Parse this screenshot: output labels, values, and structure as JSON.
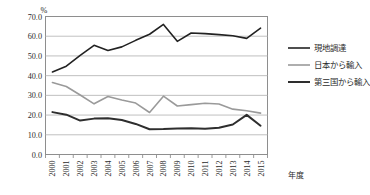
{
  "chart_data": {
    "type": "line",
    "title": "",
    "xlabel": "年度",
    "ylabel": "",
    "yunit": "%",
    "ylim": [
      0.0,
      70.0
    ],
    "ytick_step": 10.0,
    "ytick_labels": [
      "0.0",
      "10.0",
      "20.0",
      "30.0",
      "40.0",
      "50.0",
      "60.0",
      "70.0"
    ],
    "grid": true,
    "grid_axis": "y",
    "legend_position": "right",
    "categories": [
      "2000",
      "2001",
      "2002",
      "2003",
      "2004",
      "2005",
      "2006",
      "2007",
      "2008",
      "2009",
      "2010",
      "2011",
      "2012",
      "2013",
      "2014",
      "2015"
    ],
    "series": [
      {
        "name": "現地調達",
        "color": "#222222",
        "width": 1.6,
        "values": [
          41.9,
          44.8,
          50.3,
          55.4,
          52.8,
          54.6,
          57.9,
          61.0,
          66.0,
          57.4,
          61.6,
          61.3,
          60.8,
          60.2,
          58.9,
          64.1
        ]
      },
      {
        "name": "日本から輸入",
        "color": "#9a9a9a",
        "width": 1.6,
        "values": [
          36.5,
          34.5,
          30.2,
          25.7,
          29.4,
          27.6,
          26.1,
          21.3,
          29.6,
          24.6,
          25.3,
          26.0,
          25.6,
          23.0,
          22.2,
          21.0
        ]
      },
      {
        "name": "第三国から輸入",
        "color": "#2e2e2e",
        "width": 2.0,
        "values": [
          21.5,
          20.2,
          17.2,
          18.2,
          18.4,
          17.5,
          15.5,
          12.8,
          12.9,
          13.2,
          13.3,
          13.0,
          13.6,
          15.2,
          20.1,
          14.6
        ]
      }
    ]
  },
  "axis": {
    "unit_label": "%",
    "x_name": "年度"
  },
  "legend": {
    "items": [
      {
        "label": "現地調達",
        "color": "#222222"
      },
      {
        "label": "日本から輸入",
        "color": "#9a9a9a"
      },
      {
        "label": "第三国から輸入",
        "color": "#2e2e2e"
      }
    ]
  }
}
